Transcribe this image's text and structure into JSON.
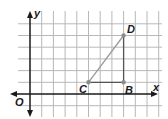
{
  "diagram": {
    "type": "coordinate-plane",
    "axes": {
      "x_label": "x",
      "y_label": "y",
      "origin_label": "O"
    },
    "grid": {
      "x_min": 0,
      "x_max": 11,
      "y_min": -1,
      "y_max": 6,
      "spacing_px": 11.7
    },
    "points": [
      {
        "name": "C",
        "x": 5,
        "y": 1
      },
      {
        "name": "B",
        "x": 8,
        "y": 1
      },
      {
        "name": "D",
        "x": 8,
        "y": 5
      }
    ],
    "segments": [
      {
        "from": "C",
        "to": "D",
        "color": "#9a9a9a"
      },
      {
        "from": "C",
        "to": "B",
        "color": "#555555"
      },
      {
        "from": "B",
        "to": "D",
        "color": "#555555"
      }
    ],
    "colors": {
      "grid": "#b8b8b8",
      "axis": "#1a1a1a",
      "point": "#8c8c8c"
    }
  }
}
